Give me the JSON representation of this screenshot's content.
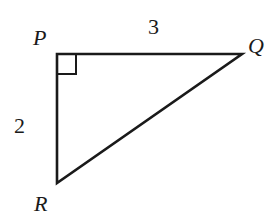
{
  "diagram": {
    "type": "right-triangle",
    "vertices": {
      "P": {
        "label": "P",
        "x": 57,
        "y": 54
      },
      "Q": {
        "label": "Q",
        "x": 242,
        "y": 54
      },
      "R": {
        "label": "R",
        "x": 57,
        "y": 183
      }
    },
    "sides": {
      "PQ": {
        "label": "3"
      },
      "PR": {
        "label": "2"
      }
    },
    "right_angle_at": "P",
    "stroke_color": "#1a1a1a"
  }
}
